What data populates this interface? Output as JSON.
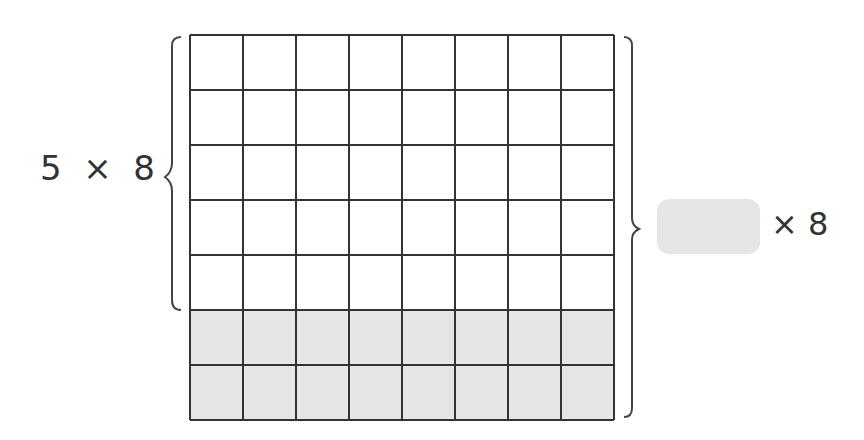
{
  "diagram": {
    "type": "area-model-multiplication",
    "grid": {
      "rows": 7,
      "columns": 8,
      "unshaded_rows": 5,
      "shaded_rows": 2,
      "shaded_color": "#e6e6e6",
      "line_color": "#333333"
    },
    "left_label": "5  ×  8",
    "left_brace_covers_rows": 5,
    "right_brace_covers_rows": 7,
    "answer_box": {
      "value": "",
      "color": "#e6e6e6"
    },
    "right_label": "× 8"
  }
}
